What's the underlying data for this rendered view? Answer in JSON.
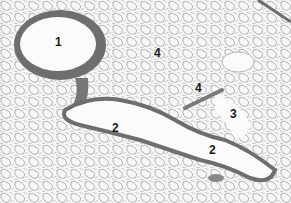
{
  "figure": {
    "type": "histology-micrograph",
    "labels": [
      {
        "text": "1",
        "x": 55,
        "y": 42
      },
      {
        "text": "4",
        "x": 154,
        "y": 52
      },
      {
        "text": "4",
        "x": 195,
        "y": 85
      },
      {
        "text": "3",
        "x": 230,
        "y": 110
      },
      {
        "text": "2",
        "x": 112,
        "y": 124
      },
      {
        "text": "2",
        "x": 209,
        "y": 145
      }
    ],
    "colors": {
      "wall": "#6e6e6e",
      "lumen": "#fbfbfb",
      "alveoli": "#9a9a9a",
      "background": "#f7f7f7"
    }
  }
}
